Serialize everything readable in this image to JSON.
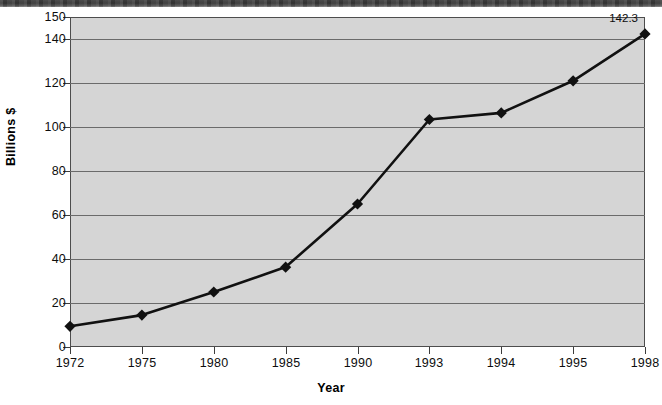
{
  "chart_data": {
    "type": "line",
    "title": "",
    "xlabel": "Year",
    "ylabel": "Billions $",
    "categories": [
      "1972",
      "1975",
      "1980",
      "1985",
      "1990",
      "1993",
      "1994",
      "1995",
      "1998"
    ],
    "values": [
      9.4,
      14.5,
      25.0,
      36.3,
      65.0,
      103.4,
      106.4,
      121.0,
      142.3
    ],
    "series": [
      {
        "name": "",
        "values": [
          9.4,
          14.5,
          25.0,
          36.3,
          65.0,
          103.4,
          106.4,
          121.0,
          142.3
        ]
      }
    ],
    "ylim": [
      0,
      150
    ],
    "yticks": [
      0,
      20,
      40,
      60,
      80,
      100,
      120,
      140,
      150
    ],
    "ytick_labels": [
      "0",
      "20",
      "40",
      "60",
      "80",
      "100",
      "120",
      "140",
      "150"
    ],
    "gridlines": [
      20,
      40,
      60,
      80,
      100,
      120,
      140
    ],
    "grid": true,
    "legend": false,
    "legend_position": "none",
    "annotations": [
      {
        "text": "142.3",
        "category": "1998",
        "value": 142.3
      }
    ],
    "marker": "diamond",
    "line_color": "#111111",
    "marker_color": "#111111",
    "plot_background": "#d5d5d5",
    "grid_color": "#6b6b6b",
    "axis_color": "#3d3d3d",
    "page_background": "#ffffff"
  }
}
